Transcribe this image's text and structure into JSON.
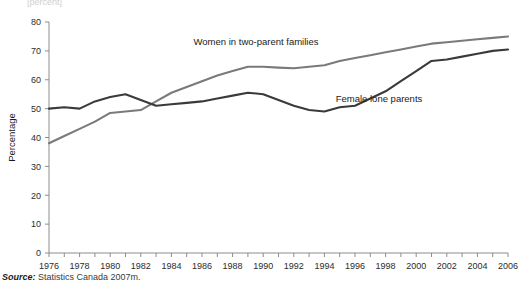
{
  "figure": {
    "source_prefix": "Source:",
    "source_text": "Statistics Canada 2007m.",
    "clipped_top_text": "[percent]"
  },
  "chart_data": {
    "type": "line",
    "title": "",
    "xlabel": "",
    "ylabel": "Percentage",
    "xlim": [
      1976,
      2006
    ],
    "ylim": [
      0,
      80
    ],
    "ytick_step": 10,
    "yticks": [
      0,
      10,
      20,
      30,
      40,
      50,
      60,
      70,
      80
    ],
    "ytick_labels": [
      "0",
      "10",
      "20",
      "30",
      "40",
      "50",
      "60",
      "70",
      "80"
    ],
    "xticks_major": [
      1976,
      1978,
      1980,
      1982,
      1984,
      1986,
      1988,
      1990,
      1992,
      1994,
      1996,
      1998,
      2000,
      2002,
      2004,
      2006
    ],
    "xtick_labels": [
      "1976",
      "1978",
      "1980",
      "1982",
      "1984",
      "1986",
      "1988",
      "1990",
      "1992",
      "1994",
      "1996",
      "1998",
      "2000",
      "2002",
      "2004",
      "2006"
    ],
    "xticks_minor_step": 1,
    "grid": false,
    "legend_position": "inline-annotations",
    "x": [
      1976,
      1977,
      1978,
      1979,
      1980,
      1981,
      1982,
      1983,
      1984,
      1985,
      1986,
      1987,
      1988,
      1989,
      1990,
      1991,
      1992,
      1993,
      1994,
      1995,
      1996,
      1997,
      1998,
      1999,
      2000,
      2001,
      2002,
      2003,
      2004,
      2005,
      2006
    ],
    "series": [
      {
        "name": "Women in two-parent families",
        "color": "#7a7a7a",
        "label_x": 1994,
        "label_y": 74,
        "values": [
          38.0,
          40.5,
          43.0,
          45.5,
          48.5,
          49.0,
          49.5,
          52.5,
          55.5,
          57.5,
          59.5,
          61.5,
          63.0,
          64.5,
          64.5,
          64.2,
          64.0,
          64.5,
          65.0,
          66.5,
          67.5,
          68.5,
          69.5,
          70.5,
          71.5,
          72.5,
          73.0,
          73.5,
          74.0,
          74.5,
          75.0
        ]
      },
      {
        "name": "Female lone parents",
        "color": "#3a3a3a",
        "label_x": 2000,
        "label_y": 52,
        "values": [
          50.0,
          50.5,
          50.0,
          52.5,
          54.0,
          55.0,
          53.0,
          51.0,
          51.5,
          52.0,
          52.5,
          53.5,
          54.5,
          55.5,
          55.0,
          53.0,
          51.0,
          49.5,
          49.0,
          50.5,
          51.0,
          53.5,
          56.0,
          59.5,
          63.0,
          66.5,
          67.0,
          68.0,
          69.0,
          70.0,
          70.5
        ]
      }
    ],
    "annotations": [
      {
        "text": "Women in two-parent families",
        "x_px": 256,
        "y_px": 45
      },
      {
        "text": "Female lone parents",
        "x_px": 379,
        "y_px": 102
      }
    ]
  }
}
